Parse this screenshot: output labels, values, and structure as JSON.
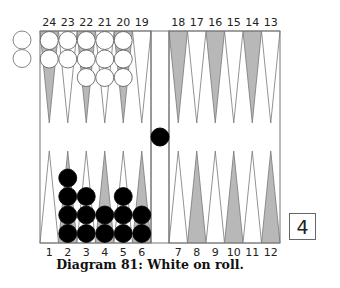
{
  "caption": "Diagram 81:  White on roll.",
  "cube_value": "4",
  "colors": {
    "board_border": "#777777",
    "dark_point": "#b8b8b8",
    "light_point": "#ffffff",
    "white_checker": "#ffffff",
    "black_checker": "#000000"
  },
  "top_labels": [
    "24",
    "23",
    "22",
    "21",
    "20",
    "19",
    "18",
    "17",
    "16",
    "15",
    "14",
    "13"
  ],
  "bottom_labels": [
    "1",
    "2",
    "3",
    "4",
    "5",
    "6",
    "7",
    "8",
    "9",
    "10",
    "11",
    "12"
  ],
  "position": {
    "white": {
      "24": 2,
      "23": 2,
      "22": 3,
      "21": 3,
      "20": 3
    },
    "black": {
      "2": 4,
      "3": 3,
      "4": 2,
      "5": 3,
      "6": 2
    },
    "black_on_bar": 1,
    "white_borne_off_shown": 2
  }
}
